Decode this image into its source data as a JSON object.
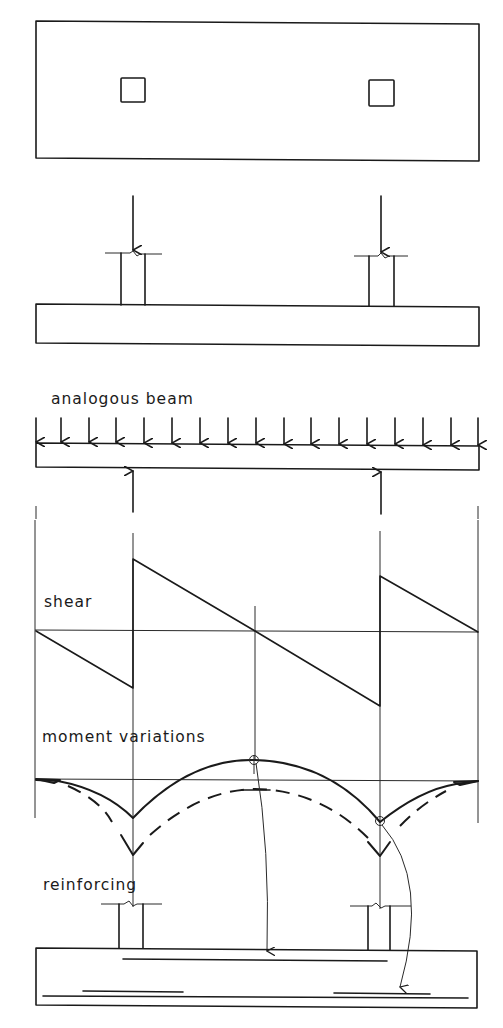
{
  "figure": {
    "labels": {
      "analogous_beam": "analogous beam",
      "shear": "shear",
      "moment_variations": "moment variations",
      "reinforcing": "reinforcing"
    },
    "panels": [
      {
        "id": "plan-view",
        "description": "plan of footing with two column squares"
      },
      {
        "id": "elevation-view",
        "description": "footing with two columns under downward loads"
      },
      {
        "id": "analogous-beam",
        "description": "beam under uniform soil pressure with column reactions",
        "uniform_load_arrow_count": 17,
        "reaction_arrow_count": 2
      },
      {
        "id": "shear-diagram",
        "description": "sawtooth shear diagram"
      },
      {
        "id": "moment-diagram",
        "description": "moment variations, solid and dashed curves"
      },
      {
        "id": "reinforcing-view",
        "description": "footing section with top and bottom reinforcing bars"
      }
    ],
    "colors": {
      "ink": "#1a1a1a",
      "background": "#ffffff"
    }
  }
}
